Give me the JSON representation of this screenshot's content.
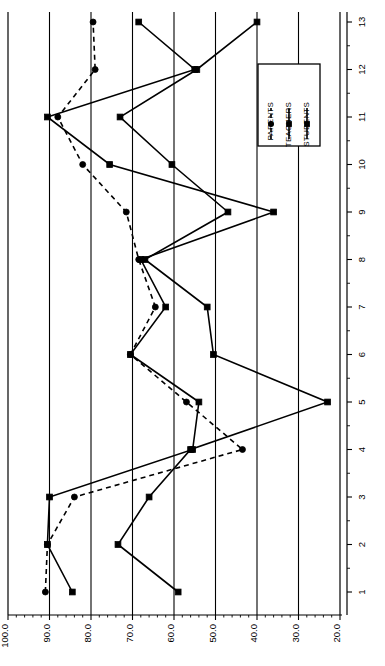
{
  "chart_data": {
    "type": "line",
    "title": "",
    "subtitle": "",
    "orientation": "rotated-90",
    "xlabel": "",
    "ylabel": "",
    "categories": [
      "1",
      "2",
      "3",
      "4",
      "5",
      "6",
      "7",
      "8",
      "9",
      "10",
      "11",
      "12",
      "13"
    ],
    "value_axis": {
      "ticks": [
        "100.0",
        "90.0",
        "80.0",
        "70.0",
        "60.0",
        "50.0",
        "40.0",
        "30.0",
        "20.0"
      ],
      "tick_values": [
        100.0,
        90.0,
        80.0,
        70.0,
        60.0,
        50.0,
        40.0,
        30.0,
        20.0
      ],
      "min": 20.0,
      "max": 100.0,
      "direction": "descending",
      "minor_ticks": true
    },
    "grid": {
      "value_axis_gridlines": true,
      "category_gridlines": false
    },
    "legend": {
      "position": "inside-right",
      "box": true,
      "entries": [
        {
          "name": "STUDENTS",
          "style": "solid",
          "marker": "square"
        },
        {
          "name": "TEACHERS",
          "style": "solid",
          "marker": "square"
        },
        {
          "name": "PARENTS",
          "style": "dashed",
          "marker": "circle"
        }
      ]
    },
    "series": [
      {
        "name": "STUDENTS",
        "style": "solid",
        "marker": "square",
        "color": "#000000",
        "values": [
          59.0,
          73.5,
          66.0,
          56.0,
          23.0,
          50.5,
          52.0,
          67.0,
          47.0,
          60.5,
          73.0,
          54.5,
          40.0
        ]
      },
      {
        "name": "TEACHERS",
        "style": "solid",
        "marker": "square",
        "color": "#000000",
        "values": [
          84.5,
          90.5,
          90.0,
          55.5,
          54.0,
          70.5,
          62.0,
          68.0,
          36.0,
          75.5,
          90.5,
          55.0,
          68.5
        ]
      },
      {
        "name": "PARENTS",
        "style": "dashed",
        "marker": "circle",
        "color": "#000000",
        "values": [
          91.0,
          90.5,
          84.0,
          43.5,
          57.0,
          70.5,
          64.5,
          68.5,
          71.5,
          82.0,
          88.0,
          79.0,
          79.5
        ]
      }
    ]
  },
  "axis_labels": {
    "value_ticks": [
      "100.0",
      "90.0",
      "80.0",
      "70.0",
      "60.0",
      "50.0",
      "40.0",
      "30.0",
      "20.0"
    ],
    "category_ticks": [
      "1",
      "2",
      "3",
      "4",
      "5",
      "6",
      "7",
      "8",
      "9",
      "10",
      "11",
      "12",
      "13"
    ]
  },
  "legend": {
    "students": "STUDENTS",
    "teachers": "TEACHERS",
    "parents": "PARENTS"
  }
}
